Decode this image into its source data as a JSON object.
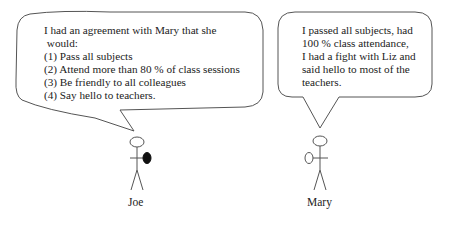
{
  "joe": {
    "name": "Joe",
    "speech": {
      "line1": "I had an agreement with Mary that she",
      "line2": " would:",
      "items": [
        "(1) Pass all subjects",
        "(2) Attend more than 80 % of class sessions",
        "(3) Be friendly to all colleagues",
        "(4) Say hello to teachers."
      ]
    },
    "holding": "filled-oval"
  },
  "mary": {
    "name": "Mary",
    "speech": {
      "lines": [
        "I passed all subjects, had",
        "100 % class attendance,",
        "I had a fight with Liz and",
        "said hello to most of the",
        "teachers."
      ]
    },
    "holding": "empty-oval"
  },
  "colors": {
    "line": "#555555",
    "text": "#222222",
    "background": "#ffffff"
  }
}
